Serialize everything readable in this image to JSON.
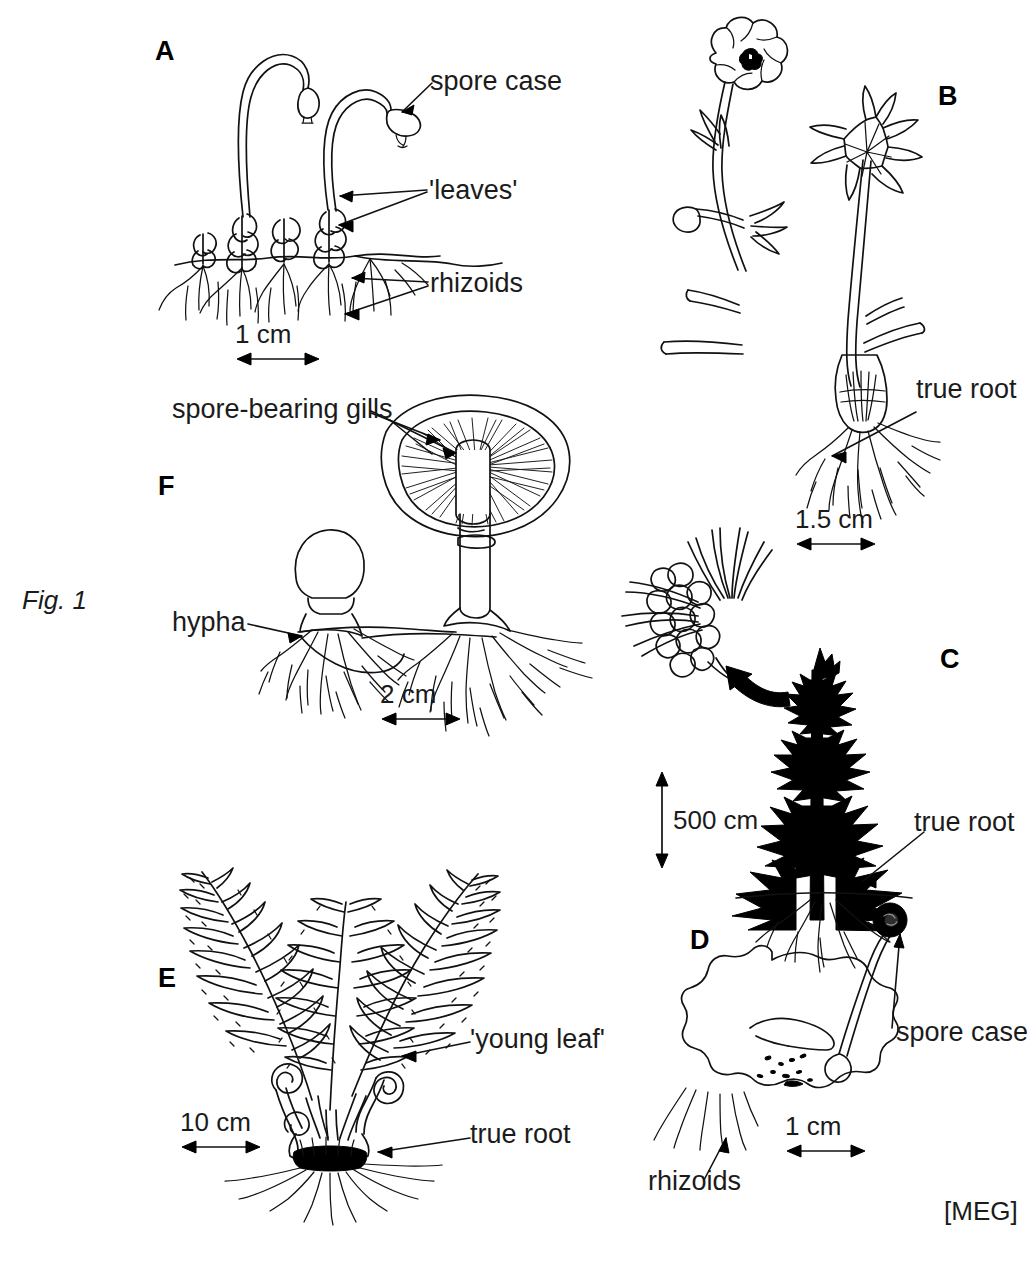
{
  "figure": {
    "label": "Fig. 1",
    "credit": "[MEG]"
  },
  "panels": [
    {
      "id": "A",
      "letter": "A",
      "organism": "moss",
      "callouts": [
        {
          "name": "spore-case",
          "text": "spore case"
        },
        {
          "name": "leaves",
          "text": "'leaves'"
        },
        {
          "name": "rhizoids",
          "text": "rhizoids"
        }
      ],
      "scale": {
        "text": "1 cm",
        "orientation": "horizontal"
      }
    },
    {
      "id": "B",
      "letter": "B",
      "organism": "flowering-plant",
      "callouts": [
        {
          "name": "true-root",
          "text": "true root"
        }
      ],
      "scale": {
        "text": "1.5 cm",
        "orientation": "horizontal"
      }
    },
    {
      "id": "C",
      "letter": "C",
      "organism": "conifer",
      "callouts": [
        {
          "name": "true-root",
          "text": "true root"
        }
      ],
      "scale": {
        "text": "500 cm",
        "orientation": "vertical"
      }
    },
    {
      "id": "D",
      "letter": "D",
      "organism": "liverwort",
      "callouts": [
        {
          "name": "spore-case",
          "text": "spore case"
        },
        {
          "name": "rhizoids",
          "text": "rhizoids"
        }
      ],
      "scale": {
        "text": "1 cm",
        "orientation": "horizontal"
      }
    },
    {
      "id": "E",
      "letter": "E",
      "organism": "fern",
      "callouts": [
        {
          "name": "young-leaf",
          "text": "'young leaf'"
        },
        {
          "name": "true-root",
          "text": "true root"
        }
      ],
      "scale": {
        "text": "10 cm",
        "orientation": "horizontal"
      }
    },
    {
      "id": "F",
      "letter": "F",
      "organism": "mushroom",
      "callouts": [
        {
          "name": "spore-bearing-gills",
          "text": "spore-bearing gills"
        },
        {
          "name": "hypha",
          "text": "hypha"
        }
      ],
      "scale": {
        "text": "2 cm",
        "orientation": "horizontal"
      }
    }
  ],
  "colors": {
    "ink": "#111111",
    "background": "#ffffff"
  }
}
